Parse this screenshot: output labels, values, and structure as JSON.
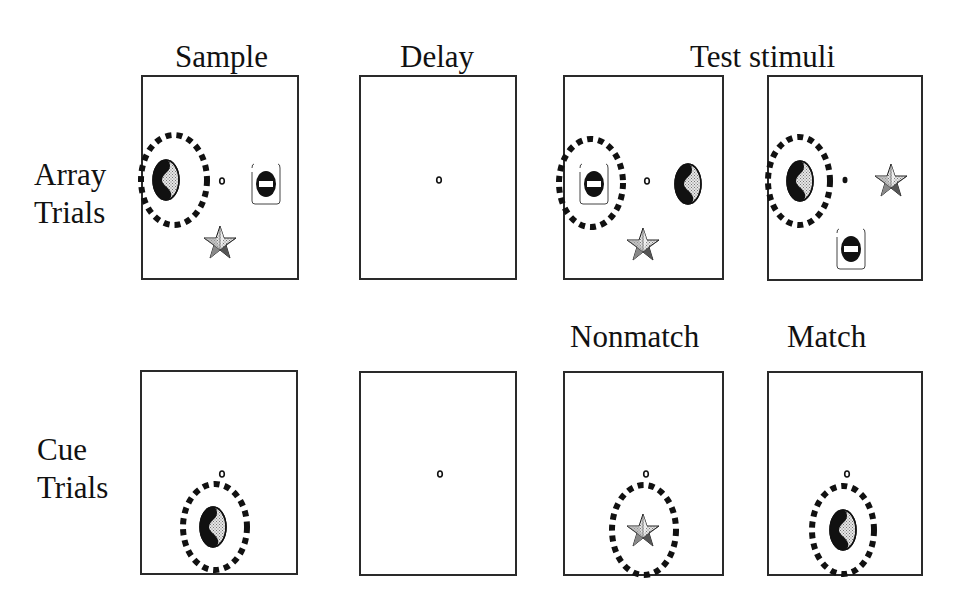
{
  "column_headers": {
    "sample": "Sample",
    "delay": "Delay",
    "test": "Test stimuli",
    "nonmatch": "Nonmatch",
    "match": "Match"
  },
  "rows": {
    "array": {
      "line1": "Array",
      "line2": "Trials"
    },
    "cue": {
      "line1": "Cue",
      "line2": "Trials"
    }
  },
  "panels": {
    "array_sample": {
      "attended": "yin-yang",
      "items": [
        "yin-yang (left, circled)",
        "fixation-point",
        "no-entry-sign (right)",
        "star (below)"
      ]
    },
    "array_delay": {
      "items": [
        "fixation-point"
      ]
    },
    "array_test_1": {
      "attended": "no-entry-sign",
      "items": [
        "no-entry-sign (left, circled)",
        "fixation-point",
        "yin-yang (right)",
        "star (below)"
      ]
    },
    "array_test_2": {
      "attended": "yin-yang",
      "items": [
        "yin-yang (left, circled)",
        "fixation-point (filled)",
        "star (right)",
        "no-entry-sign (lower right)"
      ]
    },
    "cue_sample": {
      "attended": "yin-yang",
      "items": [
        "fixation-point",
        "yin-yang (below, circled)"
      ]
    },
    "cue_delay": {
      "items": [
        "fixation-point"
      ]
    },
    "cue_nonmatch": {
      "attended": "star",
      "items": [
        "fixation-point",
        "star (below, circled)"
      ]
    },
    "cue_match": {
      "attended": "yin-yang",
      "items": [
        "fixation-point",
        "yin-yang (below, circled)"
      ]
    }
  },
  "colors": {
    "frame": "#2a2a2a",
    "ink": "#111111",
    "shade": "#bdbdbd",
    "background": "#ffffff"
  }
}
